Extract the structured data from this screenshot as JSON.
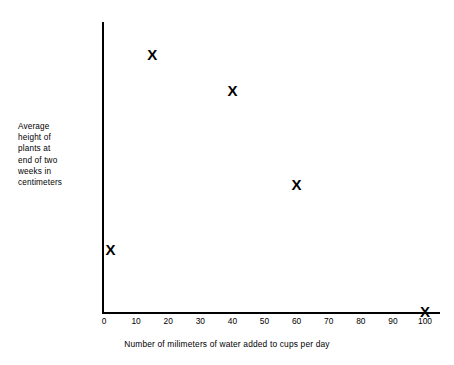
{
  "chart_data": {
    "type": "scatter",
    "title": "",
    "xlabel": "Number of milimeters of water added to cups per day",
    "ylabel": "Average height of plants at end of two weeks in centimeters",
    "ylabel_lines": [
      "Average",
      "height of",
      "plants at",
      "end of two",
      "weeks in",
      "centimeters"
    ],
    "xlim": [
      0,
      105
    ],
    "ylim": [
      -2,
      16
    ],
    "xticks": [
      0,
      10,
      20,
      30,
      40,
      50,
      60,
      70,
      80,
      90,
      100
    ],
    "xtick_labels": [
      "0",
      "10",
      "20",
      "30",
      "40",
      "50",
      "60",
      "70",
      "80",
      "90",
      "100"
    ],
    "yticks": [
      0,
      2,
      4,
      6,
      8,
      10,
      12,
      14,
      16
    ],
    "ytick_labels": [
      "0",
      "2",
      "4",
      "6",
      "8",
      "10",
      "12",
      "14",
      "16"
    ],
    "grid": false,
    "legend": false,
    "marker": "X",
    "marker_color": "#000000",
    "axis_color": "#000000",
    "points": [
      {
        "x": 2,
        "y": 2,
        "label": "X"
      },
      {
        "x": 15,
        "y": 14,
        "label": "X"
      },
      {
        "x": 40,
        "y": 11.8,
        "label": "X"
      },
      {
        "x": 60,
        "y": 6,
        "label": "X"
      },
      {
        "x": 100,
        "y": -1.8,
        "label": "X"
      }
    ]
  }
}
